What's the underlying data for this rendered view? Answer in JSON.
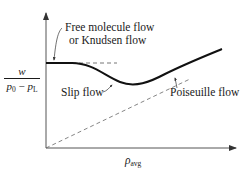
{
  "diagram": {
    "y_axis_label": {
      "numerator": "w",
      "denominator_left": "p",
      "denominator_left_sub": "0",
      "denominator_minus": " − ",
      "denominator_right": "p",
      "denominator_right_sub": "L"
    },
    "x_axis_label": {
      "main": "ρ",
      "sub": "avg"
    },
    "annotations": {
      "free_molecule_line1": "Free molecule flow",
      "free_molecule_line2": "or Knudsen flow",
      "slip": "Slip flow",
      "poiseuille": "Poiseuille flow"
    },
    "colors": {
      "ink": "#1a1a1a",
      "axis": "#555555",
      "dash": "#666666"
    }
  }
}
